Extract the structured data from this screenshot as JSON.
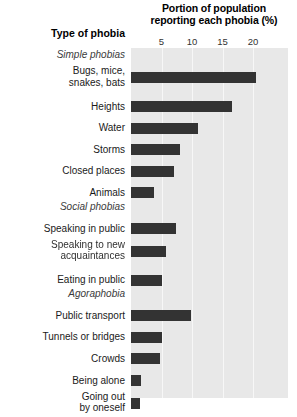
{
  "chart_data": {
    "type": "bar",
    "orientation": "horizontal",
    "title": "Portion of population reporting each phobia (%)",
    "xlabel": "Portion of population reporting each phobia (%)",
    "ylabel": "Type of phobia",
    "xlim": [
      0,
      23
    ],
    "xticks": [
      5,
      10,
      15,
      20
    ],
    "xticklabels": [
      "5",
      "10",
      "15",
      "20"
    ],
    "grid": true,
    "legend": "none",
    "bar_color": "#333333",
    "plot_background": "#e8e8e8",
    "categories": [
      "Bugs, mice, snakes, bats",
      "Heights",
      "Water",
      "Storms",
      "Closed places",
      "Animals",
      "Speaking in public",
      "Speaking to new acquaintances",
      "Eating in public",
      "Public transport",
      "Tunnels or bridges",
      "Crowds",
      "Being alone",
      "Going out by oneself"
    ],
    "values": [
      20.5,
      16.5,
      11.0,
      8.0,
      7.0,
      3.8,
      7.4,
      5.7,
      5.0,
      9.8,
      5.1,
      4.8,
      1.7,
      1.4
    ],
    "groups": [
      {
        "label": "Simple phobias",
        "members": [
          "Bugs, mice, snakes, bats",
          "Heights",
          "Water",
          "Storms",
          "Closed places",
          "Animals"
        ]
      },
      {
        "label": "Social phobias",
        "members": [
          "Speaking in public",
          "Speaking to new acquaintances",
          "Eating in public"
        ]
      },
      {
        "label": "Agoraphobia",
        "members": [
          "Public transport",
          "Tunnels or bridges",
          "Crowds",
          "Being alone",
          "Going out by oneself"
        ]
      }
    ]
  },
  "header": {
    "axis_title_line1": "Portion of population",
    "axis_title_line2": "reporting each phobia (%)",
    "category_header": "Type of phobia"
  },
  "ticks": [
    {
      "label": "5"
    },
    {
      "label": "10"
    },
    {
      "label": "15"
    },
    {
      "label": "20"
    }
  ],
  "rows": [
    {
      "kind": "group",
      "label": "Simple phobias"
    },
    {
      "kind": "bar",
      "label_line1": "Bugs, mice,",
      "label_line2": "snakes, bats",
      "value": 20.5
    },
    {
      "kind": "bar",
      "label_line1": "Heights",
      "label_line2": "",
      "value": 16.5
    },
    {
      "kind": "bar",
      "label_line1": "Water",
      "label_line2": "",
      "value": 11.0
    },
    {
      "kind": "bar",
      "label_line1": "Storms",
      "label_line2": "",
      "value": 8.0
    },
    {
      "kind": "bar",
      "label_line1": "Closed places",
      "label_line2": "",
      "value": 7.0
    },
    {
      "kind": "bar",
      "label_line1": "Animals",
      "label_line2": "",
      "value": 3.8
    },
    {
      "kind": "group",
      "label": "Social phobias"
    },
    {
      "kind": "bar",
      "label_line1": "Speaking in public",
      "label_line2": "",
      "value": 7.4
    },
    {
      "kind": "bar",
      "label_line1": "Speaking to new",
      "label_line2": "acquaintances",
      "value": 5.7
    },
    {
      "kind": "bar",
      "label_line1": "Eating in public",
      "label_line2": "",
      "value": 5.0
    },
    {
      "kind": "group",
      "label": "Agoraphobia"
    },
    {
      "kind": "bar",
      "label_line1": "Public transport",
      "label_line2": "",
      "value": 9.8
    },
    {
      "kind": "bar",
      "label_line1": "Tunnels or bridges",
      "label_line2": "",
      "value": 5.1
    },
    {
      "kind": "bar",
      "label_line1": "Crowds",
      "label_line2": "",
      "value": 4.8
    },
    {
      "kind": "bar",
      "label_line1": "Being alone",
      "label_line2": "",
      "value": 1.7
    },
    {
      "kind": "bar",
      "label_line1": "Going out",
      "label_line2": "by oneself",
      "value": 1.4
    }
  ]
}
